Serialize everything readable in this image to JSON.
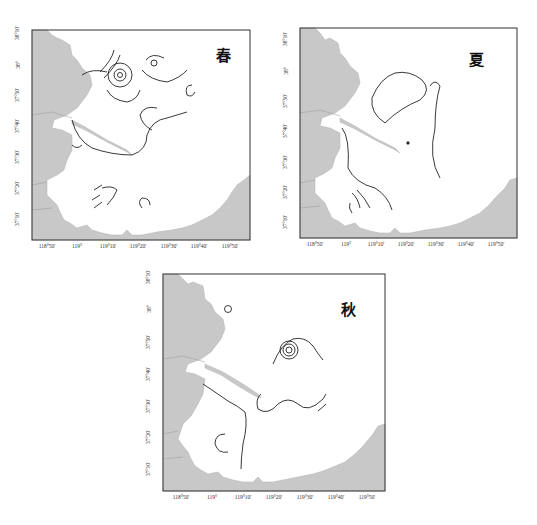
{
  "figure": {
    "land_color": "#c8c8c8",
    "sea_color": "#ffffff",
    "contour_color": "#222222",
    "x_ticks": [
      "118°50'",
      "119°",
      "119°10'",
      "119°20'",
      "119°30'",
      "119°40'",
      "119°50'"
    ],
    "y_ticks": [
      "38°10'",
      "38°",
      "37°50'",
      "37°40'",
      "37°30'",
      "37°20'",
      "37°10'"
    ]
  },
  "maps": [
    {
      "id": "spring",
      "season_label": "春",
      "contour_labels": [
        "30.6",
        "30",
        "30.6",
        "30",
        "30",
        "30",
        "30.6",
        "30.6",
        "30.6",
        "30.6",
        "30.6"
      ]
    },
    {
      "id": "summer",
      "season_label": "夏",
      "contour_labels": [
        "26",
        "26",
        "26.4",
        "26.4"
      ]
    },
    {
      "id": "autumn",
      "season_label": "秋",
      "contour_labels": [
        "28.1",
        "25.3",
        "25.3",
        "25.3",
        "25.3",
        "25.3"
      ]
    }
  ]
}
